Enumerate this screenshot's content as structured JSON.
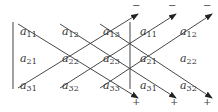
{
  "diagram": {
    "matrix": [
      [
        "a",
        "11",
        "a",
        "12",
        "a",
        "13"
      ],
      [
        "a",
        "21",
        "a",
        "22",
        "a",
        "23"
      ],
      [
        "a",
        "31",
        "a",
        "32",
        "a",
        "33"
      ]
    ],
    "cells": [
      {
        "id": "m11",
        "base": "a",
        "sub": "11",
        "x": 20,
        "y": 26
      },
      {
        "id": "m12",
        "base": "a",
        "sub": "12",
        "x": 62,
        "y": 26
      },
      {
        "id": "m13",
        "base": "a",
        "sub": "13",
        "x": 103,
        "y": 26
      },
      {
        "id": "m21",
        "base": "a",
        "sub": "21",
        "x": 20,
        "y": 53
      },
      {
        "id": "m22",
        "base": "a",
        "sub": "22",
        "x": 62,
        "y": 53
      },
      {
        "id": "m23",
        "base": "a",
        "sub": "23",
        "x": 103,
        "y": 53
      },
      {
        "id": "m31",
        "base": "a",
        "sub": "31",
        "x": 20,
        "y": 80
      },
      {
        "id": "m32",
        "base": "a",
        "sub": "32",
        "x": 62,
        "y": 80
      },
      {
        "id": "m33",
        "base": "a",
        "sub": "33",
        "x": 103,
        "y": 80
      },
      {
        "id": "r11",
        "base": "a",
        "sub": "11",
        "x": 140,
        "y": 26
      },
      {
        "id": "r12",
        "base": "a",
        "sub": "12",
        "x": 180,
        "y": 26
      },
      {
        "id": "r21",
        "base": "a",
        "sub": "21",
        "x": 140,
        "y": 53
      },
      {
        "id": "r22",
        "base": "a",
        "sub": "22",
        "x": 180,
        "y": 53
      },
      {
        "id": "r31",
        "base": "a",
        "sub": "31",
        "x": 140,
        "y": 80
      },
      {
        "id": "r32",
        "base": "a",
        "sub": "32",
        "x": 180,
        "y": 80
      }
    ],
    "minus_signs": [
      {
        "label": "−",
        "x": 132,
        "y": 2
      },
      {
        "label": "−",
        "x": 168,
        "y": 2
      },
      {
        "label": "−",
        "x": 203,
        "y": 2
      }
    ],
    "plus_signs": [
      {
        "label": "+",
        "x": 132,
        "y": 96
      },
      {
        "label": "+",
        "x": 170,
        "y": 96
      },
      {
        "label": "+",
        "x": 203,
        "y": 96
      }
    ],
    "line_color": "#333333"
  }
}
